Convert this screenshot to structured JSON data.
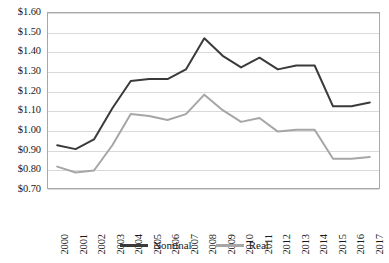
{
  "chart_data": {
    "type": "line",
    "title": "",
    "subtitle": "",
    "xlabel": "",
    "ylabel": "",
    "grid": true,
    "legend_position": "bottom",
    "ylim": [
      0.7,
      1.6
    ],
    "ytick_step": 0.1,
    "y_tick_labels": [
      "$1.60",
      "$1.50",
      "$1.40",
      "$1.30",
      "$1.20",
      "$1.10",
      "$1.00",
      "$0.90",
      "$0.80",
      "$0.70"
    ],
    "y_tick_values": [
      1.6,
      1.5,
      1.4,
      1.3,
      1.2,
      1.1,
      1.0,
      0.9,
      0.8,
      0.7
    ],
    "categories": [
      "2000",
      "2001",
      "2002",
      "2003",
      "2004",
      "2005",
      "2006",
      "2007",
      "2008",
      "2009",
      "2010",
      "2011",
      "2012",
      "2013",
      "2014",
      "2015",
      "2016",
      "2017"
    ],
    "series": [
      {
        "name": "Nominal",
        "color": "#3a3a3a",
        "values": [
          0.92,
          0.9,
          0.95,
          1.11,
          1.25,
          1.26,
          1.26,
          1.31,
          1.47,
          1.38,
          1.32,
          1.37,
          1.31,
          1.33,
          1.33,
          1.12,
          1.12,
          1.14
        ]
      },
      {
        "name": "Real",
        "color": "#a6a6a6",
        "values": [
          0.81,
          0.78,
          0.79,
          0.92,
          1.08,
          1.07,
          1.05,
          1.08,
          1.18,
          1.1,
          1.04,
          1.06,
          0.99,
          1.0,
          1.0,
          0.85,
          0.85,
          0.86
        ]
      }
    ]
  },
  "legend": {
    "entries": [
      {
        "label": "Nominal"
      },
      {
        "label": "Real"
      }
    ]
  },
  "colors": {
    "nominal": "#3a3a3a",
    "real": "#a6a6a6",
    "gridline": "#d9d9d9",
    "frame": "#a8a8a8",
    "background": "#ffffff",
    "text": "#1a1a1a"
  }
}
